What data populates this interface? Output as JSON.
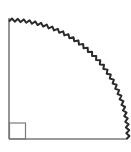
{
  "diagram": {
    "type": "quarter-circle",
    "colors": {
      "radius_lines": "#7a7a7a",
      "arc": "#2a2a2a",
      "right_angle_marker": "#7a7a7a",
      "background": "#ffffff"
    },
    "geometry": {
      "center": [
        9,
        139
      ],
      "radius": 119,
      "right_angle_marker_size": 16
    }
  }
}
